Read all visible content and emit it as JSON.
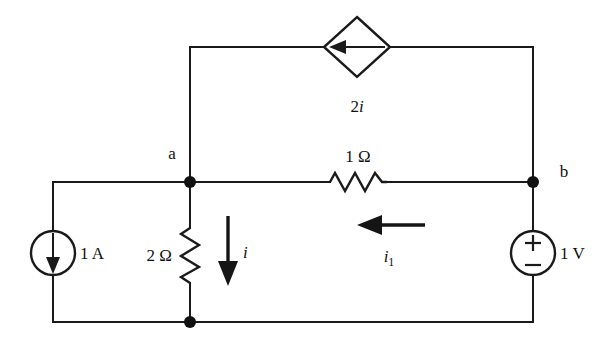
{
  "diagram": {
    "ink_color": "#1a1a1a",
    "background_color": "#ffffff",
    "nodes": [
      {
        "id": "a",
        "label": "a",
        "x": 190,
        "y": 182
      },
      {
        "id": "b",
        "label": "b",
        "x": 533,
        "y": 182
      },
      {
        "id": "ground",
        "label": "",
        "x": 190,
        "y": 322
      }
    ],
    "components": [
      {
        "id": "dependent-current-source",
        "kind": "diamond-current-source",
        "label": "2i",
        "label_base": "2",
        "label_var": "i",
        "arrow_direction": "left",
        "x": 357,
        "y": 47
      },
      {
        "id": "resistor-1ohm",
        "kind": "resistor",
        "label": "1 Ω",
        "value": "1",
        "unit": "Ω",
        "orientation": "horizontal",
        "x": 358,
        "y": 182
      },
      {
        "id": "resistor-2ohm",
        "kind": "resistor",
        "label": "2 Ω",
        "value": "2",
        "unit": "Ω",
        "orientation": "vertical",
        "x": 190,
        "y": 255
      },
      {
        "id": "independent-current-source",
        "kind": "circle-current-source",
        "label": "1 A",
        "value": "1",
        "unit": "A",
        "arrow_direction": "down",
        "x": 53,
        "y": 253
      },
      {
        "id": "independent-voltage-source",
        "kind": "circle-voltage-source",
        "label": "1 V",
        "value": "1",
        "unit": "V",
        "plus_sign": "+",
        "minus_sign": "−",
        "polarity": "plus-on-top",
        "x": 533,
        "y": 253
      }
    ],
    "current_arrows": [
      {
        "id": "current-i",
        "label": "i",
        "label_base": "i",
        "label_sub": "",
        "direction": "down",
        "x": 228,
        "y": 253
      },
      {
        "id": "current-i1",
        "label": "i1",
        "label_base": "i",
        "label_sub": "1",
        "direction": "left",
        "x": 385,
        "y": 225
      }
    ]
  }
}
